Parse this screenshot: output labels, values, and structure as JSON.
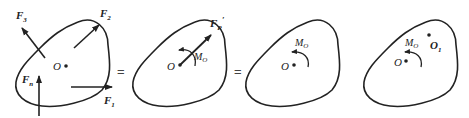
{
  "diagram": {
    "panels": [
      {
        "id": "force-system",
        "point_label": "O",
        "forces": [
          {
            "label": "F",
            "sub": "1",
            "direction": "right"
          },
          {
            "label": "F",
            "sub": "2",
            "direction": "up-right"
          },
          {
            "label": "F",
            "sub": "3",
            "direction": "up-left"
          },
          {
            "label": "F",
            "sub": "n",
            "direction": "up"
          }
        ]
      },
      {
        "id": "resultant-and-moment",
        "point_label": "O",
        "resultant": {
          "label": "F",
          "sub": "R",
          "prime": "′"
        },
        "moment": {
          "label": "M",
          "sub": "O"
        }
      },
      {
        "id": "moment-only",
        "point_label": "O",
        "moment": {
          "label": "M",
          "sub": "O"
        }
      },
      {
        "id": "moment-with-o1",
        "point_label": "O",
        "second_point": {
          "label": "O",
          "sub": "1"
        },
        "moment": {
          "label": "M",
          "sub": "O"
        }
      }
    ],
    "equals": [
      "=",
      "="
    ]
  }
}
